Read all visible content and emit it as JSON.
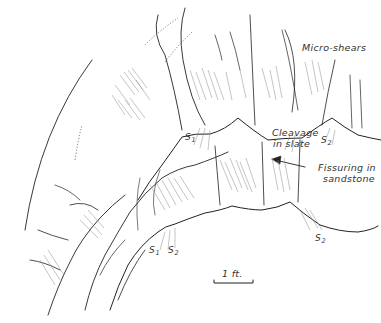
{
  "figure": {
    "type": "geological field sketch",
    "labels": {
      "micro_shears": "Micro-shears",
      "cleavage_line1": "Cleavage",
      "cleavage_line2": "in slate",
      "fissuring_line1": "Fissuring in",
      "fissuring_line2": "sandstone",
      "scale": "1 ft."
    },
    "surface_labels": [
      {
        "id": "s1-upper",
        "base": "S",
        "sub": "1"
      },
      {
        "id": "s2-upper",
        "base": "S",
        "sub": "2"
      },
      {
        "id": "s1-lower",
        "base": "S",
        "sub": "1"
      },
      {
        "id": "s2-lower",
        "base": "S",
        "sub": "2"
      },
      {
        "id": "s2-right",
        "base": "S",
        "sub": "2"
      }
    ],
    "colors": {
      "ink": "#222222",
      "hatch": "#8a8a8a",
      "background": "#ffffff"
    }
  }
}
